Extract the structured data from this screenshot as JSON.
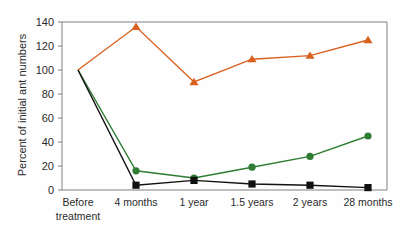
{
  "chart_data": {
    "type": "line",
    "title": "",
    "subtitle": "",
    "xlabel": "",
    "ylabel": "Percent of initial ant numbers",
    "categories": [
      "Before treatment",
      "4 months",
      "1 year",
      "1.5 years",
      "2 years",
      "28 months"
    ],
    "x_tick_labels": [
      {
        "line1": "Before",
        "line2": "treatment"
      },
      {
        "line1": "4 months",
        "line2": ""
      },
      {
        "line1": "1 year",
        "line2": ""
      },
      {
        "line1": "1.5 years",
        "line2": ""
      },
      {
        "line1": "2 years",
        "line2": ""
      },
      {
        "line1": "28 months",
        "line2": ""
      }
    ],
    "ylim": [
      0,
      140
    ],
    "y_ticks": [
      0,
      20,
      40,
      60,
      80,
      100,
      120,
      140
    ],
    "y_tick_labels": [
      "0",
      "20",
      "40",
      "60",
      "80",
      "100",
      "120",
      "140"
    ],
    "grid": false,
    "legend": "none",
    "series": [
      {
        "name": "orange-series",
        "color": "#D9611F",
        "marker": "triangle",
        "values": [
          100,
          136,
          90,
          109,
          112,
          125
        ]
      },
      {
        "name": "green-series",
        "color": "#2E7D32",
        "marker": "circle",
        "values": [
          100,
          16,
          10,
          19,
          28,
          45
        ]
      },
      {
        "name": "black-series",
        "color": "#111111",
        "marker": "square",
        "values": [
          100,
          4,
          8,
          5,
          4,
          2
        ]
      }
    ]
  },
  "colors": {
    "axis": "#808080",
    "text": "#2b2b2b",
    "background": "#fefefe",
    "orange": "#D9611F",
    "green": "#2E7D32",
    "black": "#111111"
  }
}
